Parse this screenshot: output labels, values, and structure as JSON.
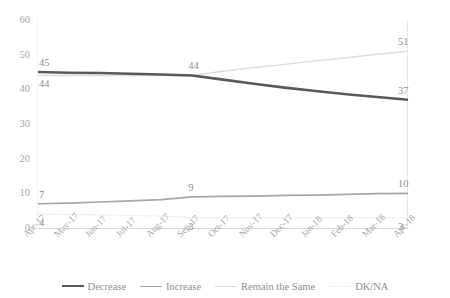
{
  "chart_data": {
    "type": "line",
    "title": "",
    "xlabel": "",
    "ylabel": "",
    "ylim": [
      0,
      60
    ],
    "ytick_step": 10,
    "grid": false,
    "legend_position": "bottom",
    "categories": [
      "Apr-17",
      "May-17",
      "Jun-17",
      "Jul-17",
      "Aug-17",
      "Sep-17",
      "Oct-17",
      "Nov-17",
      "Dec-17",
      "Jan-18",
      "Feb-18",
      "Mar-18",
      "Apr-18"
    ],
    "yticks": [
      "0",
      "10",
      "20",
      "30",
      "40",
      "50",
      "60"
    ],
    "series": [
      {
        "name": "Decrease",
        "color": "#595959",
        "values": [
          45,
          44.8,
          44.7,
          44.5,
          44.3,
          44,
          42.8,
          41.6,
          40.5,
          39.5,
          38.6,
          37.8,
          37
        ],
        "labels": [
          {
            "index": 0,
            "text": "45",
            "position": "above"
          },
          {
            "index": 5,
            "text": "44",
            "position": "above"
          },
          {
            "index": 12,
            "text": "37",
            "position": "above"
          }
        ]
      },
      {
        "name": "Increase",
        "color": "#a6a6a6",
        "values": [
          7,
          7.2,
          7.5,
          7.8,
          8.2,
          9,
          9.1,
          9.2,
          9.4,
          9.5,
          9.7,
          9.9,
          10
        ],
        "labels": [
          {
            "index": 0,
            "text": "7",
            "position": "above"
          },
          {
            "index": 5,
            "text": "9",
            "position": "above"
          },
          {
            "index": 12,
            "text": "10",
            "position": "above"
          }
        ]
      },
      {
        "name": "Remain the Same",
        "color": "#dcdcdc",
        "values": [
          44,
          44,
          44,
          44,
          44,
          44,
          45.2,
          46.3,
          47.2,
          48.2,
          49.1,
          50.1,
          51
        ],
        "labels": [
          {
            "index": 12,
            "text": "51",
            "position": "above"
          }
        ]
      },
      {
        "name": "DK/NA",
        "color": "#efefef",
        "values": [
          4,
          3.9,
          3.8,
          3.6,
          3.4,
          3,
          3,
          3,
          3,
          3,
          3,
          3,
          3
        ],
        "labels": [
          {
            "index": 0,
            "text": "4",
            "position": "below"
          },
          {
            "index": 5,
            "text": "3",
            "position": "below"
          },
          {
            "index": 12,
            "text": "3",
            "position": "below"
          }
        ]
      }
    ],
    "series_labels_below": [
      {
        "series": "Remain the Same",
        "index": 0,
        "text": "44",
        "position": "below"
      }
    ]
  }
}
